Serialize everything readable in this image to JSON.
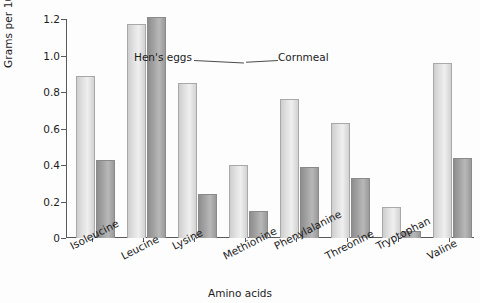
{
  "chart_data": {
    "type": "bar",
    "title": "",
    "xlabel": "Amino acids",
    "ylabel": "Grams per 100 grams",
    "ylim": [
      0,
      1.2
    ],
    "ytick_labels": [
      "1.2",
      "1.0",
      "0.8",
      "0.6",
      "0.4",
      "0.2",
      "0"
    ],
    "ytick_values": [
      1.2,
      1.0,
      0.8,
      0.6,
      0.4,
      0.2,
      0
    ],
    "grid": false,
    "legend_position": "inline-callout",
    "categories": [
      "Isoleucine",
      "Leucine",
      "Lysine",
      "Methionine",
      "Phenylalanine",
      "Threonine",
      "Tryptophan",
      "Valine"
    ],
    "series": [
      {
        "name": "Hen's eggs",
        "color": "#e2e2e2",
        "values": [
          0.89,
          1.17,
          0.85,
          0.4,
          0.76,
          0.63,
          0.17,
          0.96
        ]
      },
      {
        "name": "Cornmeal",
        "color": "#a0a0a0",
        "values": [
          0.43,
          1.21,
          0.24,
          0.15,
          0.39,
          0.33,
          0.04,
          0.44
        ]
      }
    ],
    "annotations": [
      {
        "text": "Hen's eggs",
        "target_series": "Hen's eggs",
        "target_category": "Leucine"
      },
      {
        "text": "Cornmeal",
        "target_series": "Cornmeal",
        "target_category": "Leucine"
      }
    ]
  }
}
